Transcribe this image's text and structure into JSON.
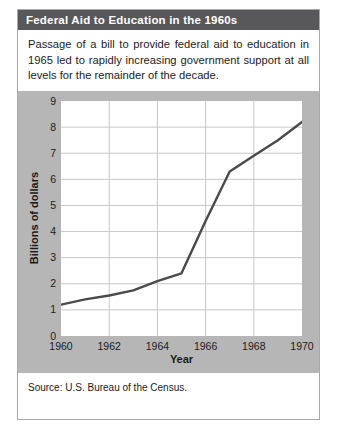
{
  "card": {
    "title": "Federal Aid to Education in the 1960s",
    "caption": "Passage of a bill to provide federal aid to education in 1965 led to rapidly increasing government support at all levels for the remainder of the decade.",
    "source": "Source: U.S. Bureau of the Census."
  },
  "colors": {
    "title_bar": "#58585a",
    "title_text": "#ffffff",
    "chart_band": "#b6b6b6",
    "plot_background": "#ffffff",
    "grid": "#c8c8c8",
    "line": "#4a4a4a",
    "card_border": "#a9a9a9"
  },
  "chart_data": {
    "type": "line",
    "title": "Federal Aid to Education in the 1960s",
    "xlabel": "Year",
    "ylabel": "Billions of dollars",
    "xlim": [
      1960,
      1970
    ],
    "ylim": [
      0,
      9
    ],
    "xticks": [
      1960,
      1962,
      1964,
      1966,
      1968,
      1970
    ],
    "yticks": [
      0,
      1,
      2,
      3,
      4,
      5,
      6,
      7,
      8,
      9
    ],
    "grid": true,
    "legend": "none",
    "x": [
      1960,
      1961,
      1962,
      1963,
      1964,
      1965,
      1966,
      1967,
      1968,
      1969,
      1970
    ],
    "values": [
      1.2,
      1.4,
      1.55,
      1.75,
      2.1,
      2.4,
      4.4,
      6.3,
      6.9,
      7.5,
      8.2
    ],
    "series": [
      {
        "name": "Federal aid to education",
        "values": [
          1.2,
          1.4,
          1.55,
          1.75,
          2.1,
          2.4,
          4.4,
          6.3,
          6.9,
          7.5,
          8.2
        ]
      }
    ]
  }
}
